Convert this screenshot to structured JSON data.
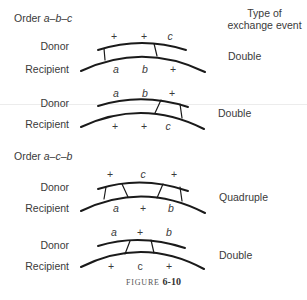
{
  "header": {
    "type_of_event_line1": "Type of",
    "type_of_event_line2": "exchange event"
  },
  "sections": [
    {
      "order_prefix": "Order ",
      "order": "a–b–c",
      "diagrams": [
        {
          "donor_label": "Donor",
          "recipient_label": "Recipient",
          "donor_markers": [
            "+",
            "+",
            "c"
          ],
          "recipient_markers": [
            "a",
            "b",
            "+"
          ],
          "event": "Double"
        },
        {
          "donor_label": "Donor",
          "recipient_label": "Recipient",
          "donor_markers": [
            "a",
            "b",
            "+"
          ],
          "recipient_markers": [
            "+",
            "+",
            "c"
          ],
          "event": "Double"
        }
      ]
    },
    {
      "order_prefix": "Order ",
      "order": "a–c–b",
      "diagrams": [
        {
          "donor_label": "Donor",
          "recipient_label": "Recipient",
          "donor_markers": [
            "+",
            "c",
            "+"
          ],
          "recipient_markers": [
            "a",
            "+",
            "b"
          ],
          "event": "Quadruple"
        },
        {
          "donor_label": "Donor",
          "recipient_label": "Recipient",
          "donor_markers": [
            "a",
            "+",
            "b"
          ],
          "recipient_markers": [
            "+",
            "c",
            "+"
          ],
          "event": "Double"
        }
      ]
    }
  ],
  "caption": {
    "prefix": "FIGURE",
    "number": "6-10"
  },
  "colors": {
    "line": "#1a1a1a",
    "text": "#3a3a3a"
  }
}
